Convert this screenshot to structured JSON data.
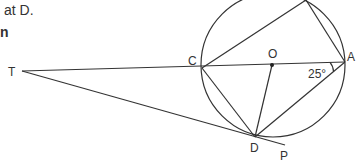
{
  "text_fragments": [
    "at D.",
    "n"
  ],
  "diagram": {
    "labels": {
      "T": "T",
      "C": "C",
      "O": "O",
      "A": "A",
      "D": "D",
      "P": "P",
      "angle": "25°"
    },
    "stroke_color": "#333333"
  }
}
